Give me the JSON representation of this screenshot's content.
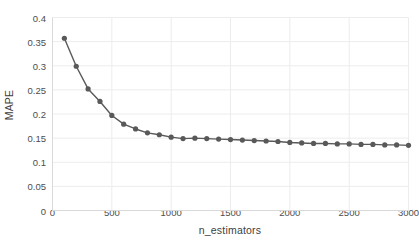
{
  "chart_data": {
    "type": "line",
    "title": "",
    "xlabel": "n_estimators",
    "ylabel": "MAPE",
    "xlim": [
      0,
      3000
    ],
    "ylim": [
      0,
      0.4
    ],
    "grid": true,
    "legend": false,
    "marker": "circle",
    "series_color": "#595959",
    "xticks": [
      0,
      500,
      1000,
      1500,
      2000,
      2500,
      3000
    ],
    "xtick_labels": [
      "0",
      "500",
      "1000",
      "1500",
      "2000",
      "2500",
      "3000"
    ],
    "yticks": [
      0,
      0.05,
      0.1,
      0.15,
      0.2,
      0.25,
      0.3,
      0.35,
      0.4
    ],
    "ytick_labels": [
      "0",
      "0.05",
      "0.1",
      "0.15",
      "0.2",
      "0.25",
      "0.3",
      "0.35",
      "0.4"
    ],
    "x": [
      100,
      200,
      300,
      400,
      500,
      600,
      700,
      800,
      900,
      1000,
      1100,
      1200,
      1300,
      1400,
      1500,
      1600,
      1700,
      1800,
      1900,
      2000,
      2100,
      2200,
      2300,
      2400,
      2500,
      2600,
      2700,
      2800,
      2900,
      3000
    ],
    "values": [
      0.357,
      0.299,
      0.252,
      0.226,
      0.197,
      0.179,
      0.169,
      0.161,
      0.157,
      0.152,
      0.149,
      0.15,
      0.149,
      0.148,
      0.147,
      0.146,
      0.145,
      0.144,
      0.143,
      0.141,
      0.14,
      0.139,
      0.139,
      0.138,
      0.138,
      0.137,
      0.137,
      0.136,
      0.136,
      0.135
    ]
  },
  "style": {
    "grid_color": "#ececec",
    "axis_color": "#d9d9d9",
    "tick_text_color": "#4d4d4d",
    "background": "#ffffff"
  }
}
